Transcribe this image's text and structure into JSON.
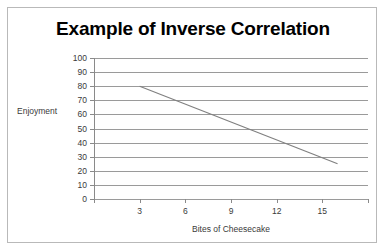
{
  "chart_data": {
    "type": "line",
    "title": "Example of Inverse Correlation",
    "xlabel": "Bites of Cheesecake",
    "ylabel": "Enjoyment",
    "x": [
      3,
      6,
      9,
      12,
      15
    ],
    "xtick_labels": [
      "3",
      "6",
      "9",
      "12",
      "15"
    ],
    "ytick_labels": [
      "100",
      "90",
      "80",
      "70",
      "60",
      "50",
      "40",
      "30",
      "20",
      "10",
      "0"
    ],
    "yticks": [
      100,
      90,
      80,
      70,
      60,
      50,
      40,
      30,
      20,
      10,
      0
    ],
    "ylim": [
      0,
      100
    ],
    "series": [
      {
        "name": "Enjoyment",
        "values": [
          80,
          67,
          55,
          42,
          30
        ],
        "endpoints": [
          {
            "x": 3,
            "y": 80
          },
          {
            "x": 16,
            "y": 25
          }
        ],
        "color": "#808080"
      }
    ],
    "grid": true,
    "grid_color": "#9a9a9a",
    "legend": "none",
    "background": "#ffffff",
    "border_color": "#b9b9b9"
  }
}
